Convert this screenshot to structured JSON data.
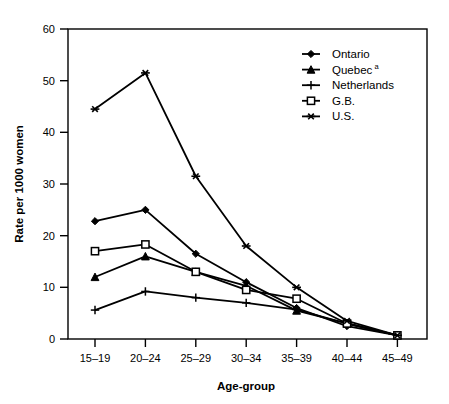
{
  "chart_data": {
    "type": "line",
    "title": "",
    "xlabel": "Age-group",
    "ylabel": "Rate per 1000 women",
    "categories": [
      "15–19",
      "20–24",
      "25–29",
      "30–34",
      "35–39",
      "40–44",
      "45–49"
    ],
    "ylim": [
      0,
      60
    ],
    "yticks": [
      0,
      10,
      20,
      30,
      40,
      50,
      60
    ],
    "grid": false,
    "legend_position": "top-right",
    "series": [
      {
        "name": "Ontario",
        "marker": "diamond",
        "values": [
          22.8,
          25.0,
          16.5,
          11.0,
          6.0,
          2.5,
          0.7
        ]
      },
      {
        "name": "Quebec",
        "name_superscript": "a",
        "marker": "triangle",
        "values": [
          12.0,
          16.0,
          13.0,
          10.3,
          5.5,
          3.0,
          0.7
        ]
      },
      {
        "name": "Netherlands",
        "marker": "plus",
        "values": [
          5.6,
          9.2,
          8.0,
          7.0,
          5.7,
          3.0,
          0.7
        ]
      },
      {
        "name": "G.B.",
        "marker": "square",
        "values": [
          17.0,
          18.3,
          13.0,
          9.5,
          7.8,
          3.0,
          0.7
        ]
      },
      {
        "name": "U.S.",
        "marker": "asterisk",
        "values": [
          44.5,
          51.5,
          31.5,
          18.0,
          10.0,
          3.5,
          0.7
        ]
      }
    ]
  },
  "axes": {
    "y_tick_labels": [
      "60",
      "50",
      "40",
      "30",
      "20",
      "10",
      "0"
    ],
    "y_title": "Rate per 1000 women",
    "x_tick_labels": [
      "15–19",
      "20–24",
      "25–29",
      "30–34",
      "35–39",
      "40–44",
      "45–49"
    ],
    "x_title": "Age-group"
  },
  "legend": {
    "entries": [
      {
        "label": "Ontario",
        "sup": ""
      },
      {
        "label": "Quebec",
        "sup": "a"
      },
      {
        "label": "Netherlands",
        "sup": ""
      },
      {
        "label": "G.B.",
        "sup": ""
      },
      {
        "label": "U.S.",
        "sup": ""
      }
    ]
  },
  "colors": {
    "line": "#000000",
    "axis": "#000000",
    "background": "#ffffff"
  }
}
